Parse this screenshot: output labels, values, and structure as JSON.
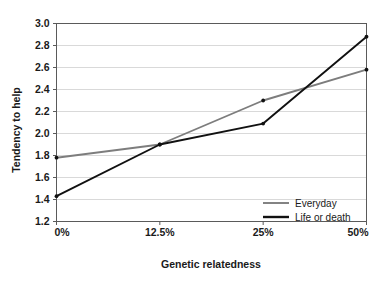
{
  "chart_data": {
    "type": "line",
    "title": "",
    "xlabel": "Genetic relatedness",
    "ylabel": "Tendency to help",
    "categories": [
      "0%",
      "12.5%",
      "25%",
      "50%"
    ],
    "x_tick_labels": [
      "0%",
      "12.5%",
      "25%",
      "50%"
    ],
    "y_tick_labels": [
      "1.2",
      "1.4",
      "1.6",
      "1.8",
      "2.0",
      "2.2",
      "2.4",
      "2.6",
      "2.8",
      "3.0"
    ],
    "y_ticks": [
      1.2,
      1.4,
      1.6,
      1.8,
      2.0,
      2.2,
      2.4,
      2.6,
      2.8,
      3.0
    ],
    "ylim": [
      1.2,
      3.0
    ],
    "grid": true,
    "grid_axis": "y",
    "legend_position": "inside-bottom-right",
    "markers": "dot",
    "series": [
      {
        "name": "Everyday",
        "color": "#7d7d7d",
        "values": [
          1.78,
          1.9,
          2.3,
          2.58
        ]
      },
      {
        "name": "Life or death",
        "color": "#111111",
        "values": [
          1.43,
          1.9,
          2.09,
          2.88
        ]
      }
    ]
  },
  "legend": {
    "items": [
      {
        "label": "Everyday",
        "color": "#7d7d7d"
      },
      {
        "label": "Life or death",
        "color": "#111111"
      }
    ]
  },
  "axes": {
    "y_title": "Tendency to help",
    "x_title": "Genetic relatedness"
  },
  "colors": {
    "background": "#ffffff",
    "frame": "#5a5a5a",
    "grid": "#d9d9d9",
    "text": "#1a1a1a",
    "series_everyday": "#7d7d7d",
    "series_life_or_death": "#111111"
  }
}
